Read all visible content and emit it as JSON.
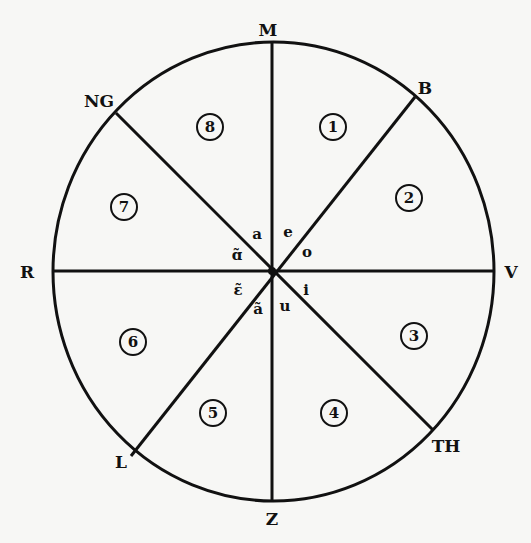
{
  "diagram": {
    "type": "circular sector diagram",
    "colors": {
      "ink": "#111111",
      "paper": "#f7f7f5"
    },
    "circle": {
      "cx": 273.5,
      "cy": 271.5,
      "rx": 220.5,
      "ry": 229.5
    },
    "axis_labels": [
      {
        "id": "top",
        "text": "M",
        "x": 268,
        "y": 30
      },
      {
        "id": "top-right",
        "text": "B",
        "x": 425,
        "y": 88
      },
      {
        "id": "right",
        "text": "V",
        "x": 511,
        "y": 272
      },
      {
        "id": "bottom-right",
        "text": "TH",
        "x": 446,
        "y": 446
      },
      {
        "id": "bottom",
        "text": "Z",
        "x": 272,
        "y": 519
      },
      {
        "id": "bottom-left",
        "text": "L",
        "x": 121,
        "y": 462
      },
      {
        "id": "left",
        "text": "R",
        "x": 27,
        "y": 272
      },
      {
        "id": "top-left",
        "text": "NG",
        "x": 99,
        "y": 101
      }
    ],
    "sectors": [
      {
        "number": "1",
        "x": 333,
        "y": 127
      },
      {
        "number": "2",
        "x": 409,
        "y": 198
      },
      {
        "number": "3",
        "x": 414,
        "y": 336
      },
      {
        "number": "4",
        "x": 334,
        "y": 413
      },
      {
        "number": "5",
        "x": 213,
        "y": 413
      },
      {
        "number": "6",
        "x": 133,
        "y": 342
      },
      {
        "number": "7",
        "x": 124,
        "y": 207
      },
      {
        "number": "8",
        "x": 210,
        "y": 127
      }
    ],
    "center_vowels": [
      {
        "text": "a",
        "x": 257,
        "y": 234
      },
      {
        "text": "e",
        "x": 288,
        "y": 232
      },
      {
        "text": "o",
        "x": 307,
        "y": 252
      },
      {
        "text": "ɑ̃",
        "x": 237,
        "y": 255
      },
      {
        "text": "ɛ̃",
        "x": 238,
        "y": 290
      },
      {
        "text": "i",
        "x": 306,
        "y": 290
      },
      {
        "text": "ã",
        "x": 258,
        "y": 309
      },
      {
        "text": "u",
        "x": 285,
        "y": 306
      }
    ]
  }
}
